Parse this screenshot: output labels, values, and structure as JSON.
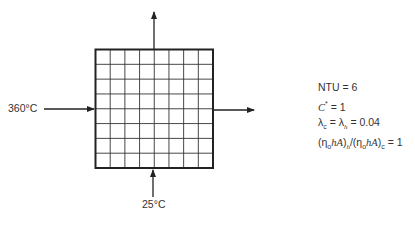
{
  "diagram": {
    "grid": {
      "rows": 8,
      "cols": 8
    },
    "inlet_hot": {
      "label": "360°C",
      "direction": "left-to-right"
    },
    "inlet_cold": {
      "label": "25°C",
      "direction": "bottom-to-top"
    },
    "outlet_hot": {
      "direction": "exits right"
    },
    "outlet_cold": {
      "direction": "exits top"
    }
  },
  "labels": {
    "hot_inlet_temp": "360°C",
    "cold_inlet_temp": "25°C"
  },
  "parameters": {
    "ntu": "NTU = 6",
    "c_star_symbol": "C",
    "c_star_sup": "*",
    "c_star_value": " = 1",
    "lambda_line": {
      "lambda": "λ",
      "sub_c": "c",
      "eq": " = λ",
      "sub_h": "h",
      "value": " = 0.04"
    },
    "ratio_line": {
      "open": "(η",
      "sub_o": "o",
      "ha": "hA",
      "close_h": ")",
      "sub_h": "h",
      "slash": "/(η",
      "sub_o2": "o",
      "ha2": "hA",
      "close_c": ")",
      "sub_c": "c",
      "value": " = 1"
    }
  }
}
